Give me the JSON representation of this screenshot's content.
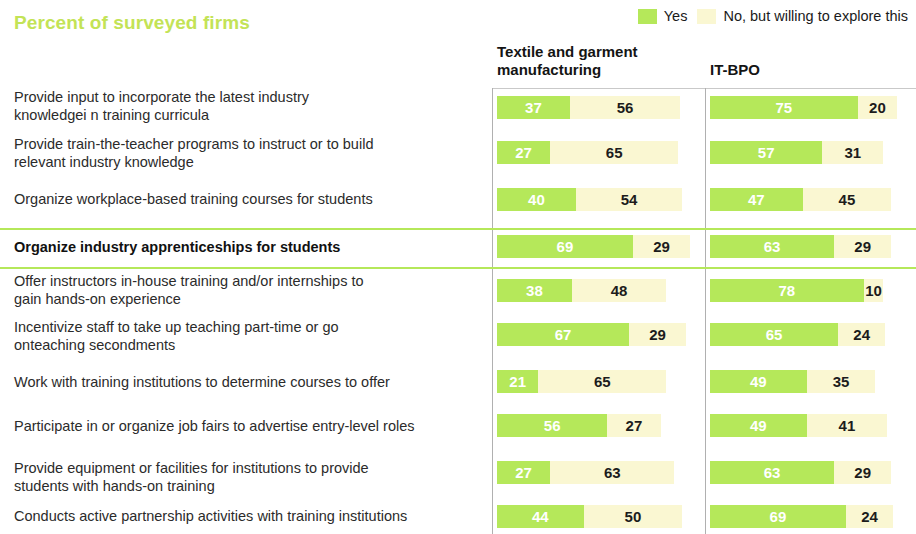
{
  "title": "Percent of surveyed firms",
  "legend": {
    "items": [
      {
        "label": "Yes",
        "color": "#b5e85a",
        "key": "yes"
      },
      {
        "label": "No, but willing to explore this",
        "color": "#faf7d2",
        "key": "no"
      }
    ]
  },
  "columns": [
    {
      "id": "textile",
      "label": "Textile and garment manufacturing"
    },
    {
      "id": "itbpo",
      "label": "IT-BPO"
    }
  ],
  "accent_color": "#b5e85a",
  "chart_data": {
    "type": "bar",
    "title": "Percent of surveyed firms",
    "subtitle": "",
    "xlabel": "",
    "ylabel": "",
    "orientation": "horizontal",
    "stacked": true,
    "grid": false,
    "legend_position": "top-right",
    "xlim": [
      0,
      100
    ],
    "units": "percent",
    "groups": [
      "Textile and garment manufacturing",
      "IT-BPO"
    ],
    "series": [
      {
        "name": "Yes",
        "color": "#b5e85a"
      },
      {
        "name": "No, but willing to explore this",
        "color": "#faf7d2"
      }
    ],
    "categories": [
      "Provide input to incorporate the latest industry knowledgei n training curricula",
      "Provide train-the-teacher programs to instruct or to build relevant industry knowledge",
      "Organize workplace-based training courses for students",
      "Organize industry apprenticeships for students",
      "Offer instructors in-house training and/or internships to gain hands-on experience",
      "Incentivize staff to take up teaching part-time or go onteaching secondments",
      "Work with training institutions to determine courses to offer",
      "Participate in or organize job fairs to advertise entry-level roles",
      "Provide equipment or facilities for institutions to provide students with hands-on training",
      "Conducts active partnership activities with training institutions"
    ],
    "rows": [
      {
        "label_line1": "Provide input to incorporate the latest industry",
        "label_line2": "knowledgei n training curricula",
        "highlight": false,
        "textile": {
          "yes": 37,
          "no": 56
        },
        "itbpo": {
          "yes": 75,
          "no": 20
        }
      },
      {
        "label_line1": "Provide train-the-teacher programs to instruct or to build",
        "label_line2": "relevant industry knowledge",
        "highlight": false,
        "textile": {
          "yes": 27,
          "no": 65
        },
        "itbpo": {
          "yes": 57,
          "no": 31
        }
      },
      {
        "label_line1": "Organize workplace-based training courses for students",
        "label_line2": "",
        "highlight": false,
        "textile": {
          "yes": 40,
          "no": 54
        },
        "itbpo": {
          "yes": 47,
          "no": 45
        }
      },
      {
        "label_line1": "Organize industry apprenticeships for students",
        "label_line2": "",
        "highlight": true,
        "textile": {
          "yes": 69,
          "no": 29
        },
        "itbpo": {
          "yes": 63,
          "no": 29
        }
      },
      {
        "label_line1": "Offer instructors in-house training and/or internships to",
        "label_line2": "gain hands-on experience",
        "highlight": false,
        "textile": {
          "yes": 38,
          "no": 48
        },
        "itbpo": {
          "yes": 78,
          "no": 10
        }
      },
      {
        "label_line1": "Incentivize staff to take up teaching part-time or go",
        "label_line2": "onteaching secondments",
        "highlight": false,
        "textile": {
          "yes": 67,
          "no": 29
        },
        "itbpo": {
          "yes": 65,
          "no": 24
        }
      },
      {
        "label_line1": "Work with training institutions to determine courses to offer",
        "label_line2": "",
        "highlight": false,
        "textile": {
          "yes": 21,
          "no": 65
        },
        "itbpo": {
          "yes": 49,
          "no": 35
        }
      },
      {
        "label_line1": "Participate in or organize job fairs to advertise entry-level roles",
        "label_line2": "",
        "highlight": false,
        "textile": {
          "yes": 56,
          "no": 27
        },
        "itbpo": {
          "yes": 49,
          "no": 41
        }
      },
      {
        "label_line1": "Provide equipment or facilities for institutions to provide",
        "label_line2": "students with hands-on training",
        "highlight": false,
        "textile": {
          "yes": 27,
          "no": 63
        },
        "itbpo": {
          "yes": 63,
          "no": 29
        }
      },
      {
        "label_line1": "Conducts active partnership activities with training institutions",
        "label_line2": "",
        "highlight": false,
        "textile": {
          "yes": 44,
          "no": 50
        },
        "itbpo": {
          "yes": 69,
          "no": 24
        }
      }
    ]
  },
  "layout": {
    "row_tops": [
      96,
      141,
      188,
      235,
      279,
      323,
      370,
      414,
      461,
      505
    ],
    "label_tops": [
      88,
      135,
      190,
      238,
      272,
      318,
      373,
      417,
      459,
      507
    ],
    "bar_left_textile": 497,
    "bar_left_itbpo": 710,
    "px_per_percent": 1.97
  }
}
